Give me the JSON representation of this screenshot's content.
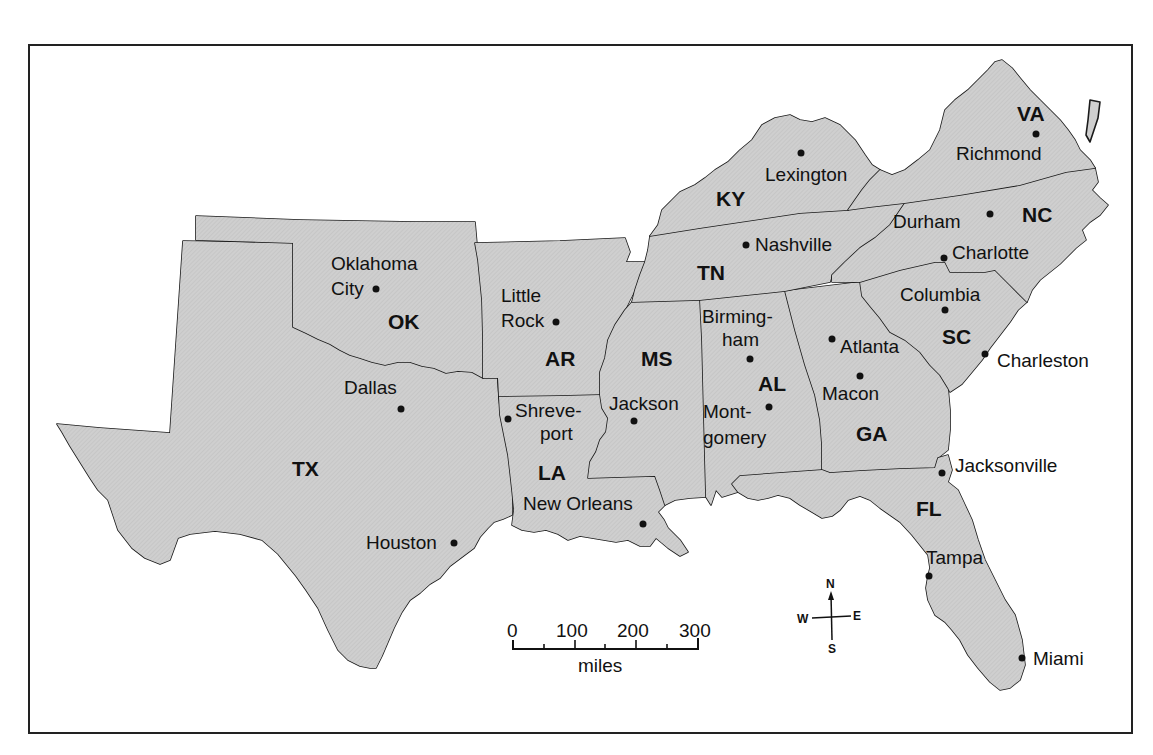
{
  "map": {
    "fill_color": "#cfcfcf",
    "border_color": "#1a1a1a",
    "states": [
      {
        "abbr": "VA",
        "name": "Virginia"
      },
      {
        "abbr": "KY",
        "name": "Kentucky"
      },
      {
        "abbr": "NC",
        "name": "North Carolina"
      },
      {
        "abbr": "TN",
        "name": "Tennessee"
      },
      {
        "abbr": "OK",
        "name": "Oklahoma"
      },
      {
        "abbr": "AR",
        "name": "Arkansas"
      },
      {
        "abbr": "SC",
        "name": "South Carolina"
      },
      {
        "abbr": "MS",
        "name": "Mississippi"
      },
      {
        "abbr": "AL",
        "name": "Alabama"
      },
      {
        "abbr": "GA",
        "name": "Georgia"
      },
      {
        "abbr": "TX",
        "name": "Texas"
      },
      {
        "abbr": "LA",
        "name": "Louisiana"
      },
      {
        "abbr": "FL",
        "name": "Florida"
      }
    ],
    "cities": {
      "richmond": "Richmond",
      "lexington": "Lexington",
      "durham": "Durham",
      "nashville": "Nashville",
      "charlotte": "Charlotte",
      "oklahoma_city_1": "Oklahoma",
      "oklahoma_city_2": "City",
      "little_rock_1": "Little",
      "little_rock_2": "Rock",
      "columbia": "Columbia",
      "birmingham_1": "Birming-",
      "birmingham_2": "ham",
      "atlanta": "Atlanta",
      "charleston": "Charleston",
      "dallas": "Dallas",
      "macon": "Macon",
      "jackson": "Jackson",
      "shreveport_1": "Shreve-",
      "shreveport_2": "port",
      "montgomery_1": "Mont-",
      "montgomery_2": "gomery",
      "jacksonville": "Jacksonville",
      "new_orleans": "New Orleans",
      "houston": "Houston",
      "tampa": "Tampa",
      "miami": "Miami"
    }
  },
  "scale_bar": {
    "ticks": [
      "0",
      "100",
      "200",
      "300"
    ],
    "unit": "miles"
  },
  "compass": {
    "north": "N",
    "south": "S",
    "east": "E",
    "west": "W"
  }
}
